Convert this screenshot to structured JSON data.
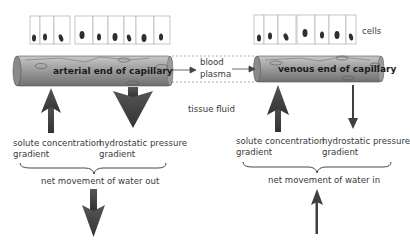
{
  "labels": {
    "cells": "cells",
    "arterial": "arterial end of capillary",
    "venous": "venous end of capillary",
    "blood": "blood",
    "plasma": "plasma",
    "tissue_fluid": "tissue fluid"
  },
  "arterial_side": {
    "solute_line1": "solute concentration",
    "solute_line2": "gradient",
    "hydro_line1": "hydrostatic pressure",
    "hydro_line2": "gradient",
    "net": "net movement of water out"
  },
  "venous_side": {
    "solute_line1": "solute concentration",
    "solute_line2": "gradient",
    "hydro_line1": "hydrostatic pressure",
    "hydro_line2": "gradient",
    "net": "net movement of water in"
  },
  "colors": {
    "tube": "#9a9a9a",
    "arrow": "#3f3f3f",
    "cell_border": "#b8b8b8",
    "nucleus": "#2e2e2e"
  }
}
